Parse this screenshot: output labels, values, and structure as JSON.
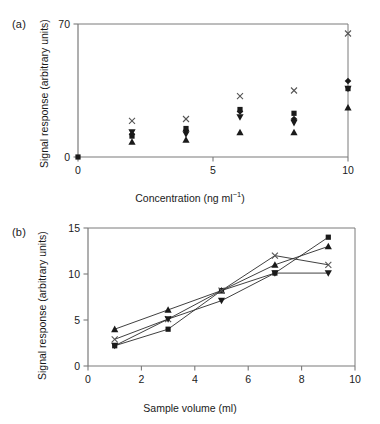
{
  "figure": {
    "panel_a_label": "(a)",
    "panel_b_label": "(b)"
  },
  "chart_data": [
    {
      "panel": "(a)",
      "type": "scatter",
      "title": "",
      "xlabel": "Concentration (ng ml⁻¹)",
      "ylabel": "Signal response (arbitrary units)",
      "xlim": [
        0,
        10
      ],
      "ylim": [
        0,
        70
      ],
      "xticks": [
        0,
        5,
        10
      ],
      "xtick_labels": [
        "0",
        "5",
        "10"
      ],
      "yticks": [
        0,
        70
      ],
      "ytick_labels": [
        "0",
        "70"
      ],
      "grid": false,
      "legend": "none",
      "x": [
        0,
        2,
        4,
        6,
        8,
        10
      ],
      "series": [
        {
          "name": "cross",
          "marker": "x",
          "values": [
            0,
            19,
            20,
            32,
            35,
            65
          ]
        },
        {
          "name": "square",
          "marker": "square",
          "values": [
            0,
            11,
            15,
            25,
            23,
            36
          ]
        },
        {
          "name": "diamond",
          "marker": "diamond",
          "values": [
            0,
            12,
            14,
            24,
            20,
            40
          ]
        },
        {
          "name": "triangle-down",
          "marker": "triangle-down",
          "values": [
            0,
            13,
            12,
            21,
            18,
            36
          ]
        },
        {
          "name": "triangle-up",
          "marker": "triangle-up",
          "values": [
            0,
            8,
            9,
            13,
            13,
            26
          ]
        }
      ]
    },
    {
      "panel": "(b)",
      "type": "line",
      "title": "",
      "xlabel": "Sample volume (ml)",
      "ylabel": "Signal response (arbitrary units)",
      "xlim": [
        0,
        10
      ],
      "ylim": [
        0,
        15
      ],
      "xticks": [
        0,
        2,
        4,
        6,
        8,
        10
      ],
      "xtick_labels": [
        "0",
        "2",
        "4",
        "6",
        "8",
        "10"
      ],
      "yticks": [
        0,
        5,
        10,
        15
      ],
      "ytick_labels": [
        "0",
        "5",
        "10",
        "15"
      ],
      "grid": false,
      "legend": "none",
      "x": [
        1,
        3,
        5,
        7,
        9
      ],
      "series": [
        {
          "name": "square",
          "marker": "square",
          "values": [
            2.2,
            4.0,
            8.2,
            10.1,
            14.0
          ]
        },
        {
          "name": "triangle-up",
          "marker": "triangle-up",
          "values": [
            4.0,
            6.1,
            8.2,
            11.0,
            13.0
          ]
        },
        {
          "name": "cross",
          "marker": "x",
          "values": [
            2.9,
            5.1,
            8.2,
            12.0,
            11.0
          ]
        },
        {
          "name": "triangle-down",
          "marker": "triangle-down",
          "values": [
            2.2,
            5.1,
            7.1,
            10.1,
            10.1
          ]
        }
      ]
    }
  ]
}
